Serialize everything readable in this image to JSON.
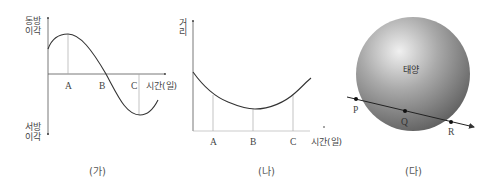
{
  "panels": {
    "ga": {
      "caption": "(가)",
      "y_top_label_line1": "동방",
      "y_top_label_line2": "이각",
      "y_bottom_label_line1": "서방",
      "y_bottom_label_line2": "이각",
      "x_label": "시간(일)",
      "points": [
        "A",
        "B",
        "C"
      ]
    },
    "na": {
      "caption": "(나)",
      "y_label_line1": "거",
      "y_label_line2": "리",
      "x_label": "시간(일)",
      "points": [
        "A",
        "B",
        "C"
      ]
    },
    "da": {
      "caption": "(다)",
      "sun_label": "태양",
      "points": [
        "P",
        "Q",
        "R"
      ]
    }
  },
  "colors": {
    "line": "#333333",
    "guide": "#aaaaaa",
    "sphere_light": "#e6e6e6",
    "sphere_dark": "#6e6e6e"
  }
}
